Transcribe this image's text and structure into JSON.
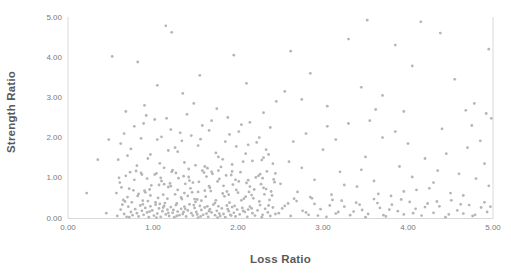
{
  "chart_data": {
    "type": "scatter",
    "title": "",
    "xlabel": "Loss Ratio",
    "ylabel": "Strength Ratio",
    "xlim": [
      0,
      5
    ],
    "ylim": [
      0,
      5
    ],
    "x_tick_labels": [
      "0.00",
      "1.00",
      "2.00",
      "3.00",
      "4.00",
      "5.00"
    ],
    "y_tick_labels": [
      "0.00",
      "1.00",
      "2.00",
      "3.00",
      "4.00",
      "5.00"
    ],
    "grid": false,
    "legend": false,
    "marker_color": "#b5b5b5",
    "axis_line_color": "#d9d9d9",
    "tick_label_color": "#7a7a7a",
    "axis_title_color": "#595959",
    "points": [
      [
        0.58,
        0.05
      ],
      [
        0.62,
        0.21
      ],
      [
        0.66,
        0.1
      ],
      [
        0.69,
        0.03
      ],
      [
        0.71,
        0.28
      ],
      [
        0.74,
        0.15
      ],
      [
        0.76,
        0.07
      ],
      [
        0.79,
        0.22
      ],
      [
        0.81,
        0.12
      ],
      [
        0.83,
        0.04
      ],
      [
        0.85,
        0.31
      ],
      [
        0.87,
        0.18
      ],
      [
        0.89,
        0.08
      ],
      [
        0.91,
        0.25
      ],
      [
        0.93,
        0.14
      ],
      [
        0.95,
        0.02
      ],
      [
        0.97,
        0.29
      ],
      [
        0.99,
        0.19
      ],
      [
        1.01,
        0.06
      ],
      [
        1.03,
        0.33
      ],
      [
        1.05,
        0.11
      ],
      [
        1.07,
        0.24
      ],
      [
        1.09,
        0.03
      ],
      [
        1.11,
        0.17
      ],
      [
        1.13,
        0.3
      ],
      [
        1.15,
        0.09
      ],
      [
        1.17,
        0.21
      ],
      [
        1.19,
        0.05
      ],
      [
        1.21,
        0.27
      ],
      [
        1.23,
        0.13
      ],
      [
        1.25,
        0.02
      ],
      [
        1.27,
        0.32
      ],
      [
        1.29,
        0.16
      ],
      [
        1.31,
        0.07
      ],
      [
        1.33,
        0.23
      ],
      [
        1.35,
        0.1
      ],
      [
        1.37,
        0.28
      ],
      [
        1.39,
        0.04
      ],
      [
        1.41,
        0.19
      ],
      [
        1.43,
        0.34
      ],
      [
        1.45,
        0.12
      ],
      [
        1.47,
        0.06
      ],
      [
        1.49,
        0.25
      ],
      [
        1.51,
        0.15
      ],
      [
        1.53,
        0.01
      ],
      [
        1.55,
        0.3
      ],
      [
        1.57,
        0.2
      ],
      [
        1.59,
        0.08
      ],
      [
        1.61,
        0.26
      ],
      [
        1.63,
        0.11
      ],
      [
        1.65,
        0.03
      ],
      [
        1.67,
        0.22
      ],
      [
        1.69,
        0.14
      ],
      [
        1.71,
        0.33
      ],
      [
        1.73,
        0.07
      ],
      [
        1.75,
        0.18
      ],
      [
        1.77,
        0.29
      ],
      [
        1.79,
        0.05
      ],
      [
        1.81,
        0.24
      ],
      [
        1.83,
        0.1
      ],
      [
        1.85,
        0.02
      ],
      [
        1.87,
        0.31
      ],
      [
        1.89,
        0.17
      ],
      [
        1.91,
        0.08
      ],
      [
        1.93,
        0.27
      ],
      [
        1.95,
        0.13
      ],
      [
        1.97,
        0.04
      ],
      [
        1.99,
        0.21
      ],
      [
        2.02,
        0.09
      ],
      [
        2.05,
        0.25
      ],
      [
        2.08,
        0.15
      ],
      [
        2.11,
        0.03
      ],
      [
        2.14,
        0.28
      ],
      [
        2.17,
        0.12
      ],
      [
        2.2,
        0.06
      ],
      [
        2.23,
        0.19
      ],
      [
        2.26,
        0.32
      ],
      [
        2.29,
        0.08
      ],
      [
        2.32,
        0.23
      ],
      [
        2.35,
        0.14
      ],
      [
        2.38,
        0.05
      ],
      [
        2.41,
        0.26
      ],
      [
        2.44,
        0.1
      ],
      [
        0.64,
        0.33
      ],
      [
        0.72,
        0.02
      ],
      [
        0.88,
        0.34
      ],
      [
        0.96,
        0.16
      ],
      [
        1.04,
        0.01
      ],
      [
        1.12,
        0.26
      ],
      [
        1.24,
        0.2
      ],
      [
        1.36,
        0.15
      ],
      [
        1.48,
        0.32
      ],
      [
        1.56,
        0.04
      ],
      [
        1.64,
        0.29
      ],
      [
        1.76,
        0.01
      ],
      [
        1.88,
        0.22
      ],
      [
        1.96,
        0.3
      ],
      [
        2.06,
        0.18
      ],
      [
        2.16,
        0.24
      ],
      [
        2.28,
        0.02
      ],
      [
        1.08,
        0.35
      ],
      [
        1.18,
        0.13
      ],
      [
        1.28,
        0.05
      ],
      [
        1.38,
        0.23
      ],
      [
        1.52,
        0.09
      ],
      [
        1.66,
        0.17
      ],
      [
        1.78,
        0.11
      ],
      [
        1.92,
        0.06
      ],
      [
        2.12,
        0.21
      ],
      [
        2.36,
        0.31
      ],
      [
        0.57,
        0.62
      ],
      [
        0.61,
        0.88
      ],
      [
        0.65,
        0.45
      ],
      [
        0.68,
        1.05
      ],
      [
        0.72,
        0.73
      ],
      [
        0.75,
        0.39
      ],
      [
        0.78,
        0.95
      ],
      [
        0.82,
        0.55
      ],
      [
        0.86,
        1.12
      ],
      [
        0.9,
        0.68
      ],
      [
        0.94,
        0.42
      ],
      [
        0.98,
        0.81
      ],
      [
        1.02,
        1.08
      ],
      [
        1.06,
        0.5
      ],
      [
        1.1,
        0.92
      ],
      [
        1.14,
        0.37
      ],
      [
        1.18,
        0.77
      ],
      [
        1.22,
        1.15
      ],
      [
        1.26,
        0.59
      ],
      [
        1.3,
        0.99
      ],
      [
        1.34,
        0.47
      ],
      [
        1.38,
        0.85
      ],
      [
        1.42,
        1.02
      ],
      [
        1.46,
        0.64
      ],
      [
        1.5,
        0.4
      ],
      [
        1.54,
        0.9
      ],
      [
        1.58,
        1.18
      ],
      [
        1.62,
        0.53
      ],
      [
        1.66,
        0.79
      ],
      [
        1.7,
        1.1
      ],
      [
        1.74,
        0.44
      ],
      [
        1.78,
        0.97
      ],
      [
        1.82,
        0.61
      ],
      [
        1.86,
        1.06
      ],
      [
        1.9,
        0.38
      ],
      [
        1.94,
        0.83
      ],
      [
        1.98,
        0.7
      ],
      [
        2.03,
        1.14
      ],
      [
        2.07,
        0.48
      ],
      [
        2.12,
        0.94
      ],
      [
        2.16,
        0.57
      ],
      [
        2.21,
        1.01
      ],
      [
        2.25,
        0.41
      ],
      [
        2.3,
        0.75
      ],
      [
        2.34,
        1.16
      ],
      [
        2.39,
        0.66
      ],
      [
        2.43,
        0.89
      ],
      [
        0.6,
        1.0
      ],
      [
        0.7,
        0.52
      ],
      [
        0.8,
        1.17
      ],
      [
        0.88,
        0.43
      ],
      [
        0.96,
        0.71
      ],
      [
        1.04,
        1.11
      ],
      [
        1.12,
        0.58
      ],
      [
        1.2,
        0.86
      ],
      [
        1.28,
        0.36
      ],
      [
        1.36,
        1.04
      ],
      [
        1.44,
        0.74
      ],
      [
        1.52,
        0.46
      ],
      [
        1.6,
        1.13
      ],
      [
        1.68,
        0.67
      ],
      [
        1.76,
        0.91
      ],
      [
        1.84,
        0.54
      ],
      [
        1.92,
        1.07
      ],
      [
        2.0,
        0.63
      ],
      [
        2.1,
        0.87
      ],
      [
        2.18,
        0.49
      ],
      [
        2.26,
        1.09
      ],
      [
        2.33,
        0.72
      ],
      [
        2.4,
        0.56
      ],
      [
        0.63,
        0.76
      ],
      [
        0.73,
        1.14
      ],
      [
        0.83,
        0.6
      ],
      [
        0.93,
        0.98
      ],
      [
        1.03,
        0.39
      ],
      [
        1.13,
        0.84
      ],
      [
        1.23,
        1.19
      ],
      [
        1.33,
        0.51
      ],
      [
        1.43,
        0.93
      ],
      [
        1.53,
        0.65
      ],
      [
        1.63,
        1.03
      ],
      [
        1.73,
        0.37
      ],
      [
        1.83,
        0.8
      ],
      [
        1.93,
        1.16
      ],
      [
        2.04,
        0.44
      ],
      [
        2.14,
        0.78
      ],
      [
        2.24,
        1.05
      ],
      [
        2.31,
        0.59
      ],
      [
        2.42,
        0.96
      ],
      [
        0.67,
        0.41
      ],
      [
        0.77,
        0.69
      ],
      [
        0.87,
        1.08
      ],
      [
        0.97,
        0.56
      ],
      [
        1.07,
        0.82
      ],
      [
        1.17,
        0.48
      ],
      [
        1.27,
        1.12
      ],
      [
        1.37,
        0.62
      ],
      [
        1.47,
        0.88
      ],
      [
        1.57,
        0.43
      ],
      [
        1.67,
        0.75
      ],
      [
        1.77,
        1.18
      ],
      [
        1.87,
        0.66
      ],
      [
        1.97,
        0.95
      ],
      [
        2.09,
        0.53
      ],
      [
        2.19,
        0.71
      ],
      [
        2.29,
        0.99
      ],
      [
        2.37,
        0.45
      ],
      [
        0.91,
        0.64
      ],
      [
        1.09,
        1.0
      ],
      [
        1.29,
        0.7
      ],
      [
        1.49,
        0.47
      ],
      [
        1.69,
        1.15
      ],
      [
        1.89,
        0.58
      ],
      [
        2.01,
        0.91
      ],
      [
        2.13,
        0.65
      ],
      [
        2.27,
        0.84
      ],
      [
        2.44,
        1.11
      ],
      [
        1.21,
        0.79
      ],
      [
        1.41,
        0.55
      ],
      [
        1.61,
        0.68
      ],
      [
        0.59,
        1.45
      ],
      [
        0.66,
        2.1
      ],
      [
        0.74,
        1.72
      ],
      [
        0.81,
        1.3
      ],
      [
        0.89,
        2.35
      ],
      [
        0.97,
        1.58
      ],
      [
        1.05,
        1.95
      ],
      [
        1.13,
        1.25
      ],
      [
        1.21,
        2.2
      ],
      [
        1.29,
        1.65
      ],
      [
        1.37,
        1.38
      ],
      [
        1.45,
        2.05
      ],
      [
        1.53,
        1.8
      ],
      [
        1.61,
        1.28
      ],
      [
        1.69,
        2.42
      ],
      [
        1.77,
        1.52
      ],
      [
        1.85,
        1.9
      ],
      [
        1.93,
        1.33
      ],
      [
        2.01,
        2.15
      ],
      [
        2.09,
        1.6
      ],
      [
        2.17,
        1.42
      ],
      [
        2.25,
        2.0
      ],
      [
        2.33,
        1.7
      ],
      [
        2.41,
        1.35
      ],
      [
        0.62,
        1.85
      ],
      [
        0.78,
        2.28
      ],
      [
        0.94,
        1.48
      ],
      [
        1.1,
        2.02
      ],
      [
        1.26,
        1.75
      ],
      [
        1.42,
        1.22
      ],
      [
        1.58,
        2.3
      ],
      [
        1.74,
        1.62
      ],
      [
        1.9,
        2.08
      ],
      [
        2.06,
        1.4
      ],
      [
        2.22,
        1.88
      ],
      [
        2.38,
        2.25
      ],
      [
        0.7,
        1.55
      ],
      [
        0.86,
        1.98
      ],
      [
        1.02,
        2.45
      ],
      [
        1.18,
        1.68
      ],
      [
        1.34,
        1.92
      ],
      [
        1.5,
        1.31
      ],
      [
        1.66,
        2.18
      ],
      [
        1.82,
        1.46
      ],
      [
        1.98,
        1.78
      ],
      [
        2.14,
        2.38
      ],
      [
        2.3,
        1.5
      ],
      [
        0.92,
        2.55
      ],
      [
        1.16,
        2.48
      ],
      [
        1.4,
        2.58
      ],
      [
        1.64,
        1.24
      ],
      [
        1.88,
        2.5
      ],
      [
        2.12,
        1.82
      ],
      [
        2.36,
        1.58
      ],
      [
        1.08,
        1.36
      ],
      [
        1.32,
        2.12
      ],
      [
        1.56,
        1.96
      ],
      [
        1.8,
        1.27
      ],
      [
        2.04,
        2.32
      ],
      [
        2.28,
        1.44
      ],
      [
        2.48,
        0.12
      ],
      [
        2.55,
        0.3
      ],
      [
        2.62,
        0.05
      ],
      [
        2.69,
        0.42
      ],
      [
        2.76,
        0.18
      ],
      [
        2.83,
        0.08
      ],
      [
        2.9,
        0.35
      ],
      [
        2.97,
        0.22
      ],
      [
        3.04,
        0.03
      ],
      [
        3.11,
        0.45
      ],
      [
        3.18,
        0.15
      ],
      [
        3.25,
        0.28
      ],
      [
        3.32,
        0.07
      ],
      [
        3.39,
        0.38
      ],
      [
        3.46,
        0.2
      ],
      [
        3.53,
        0.1
      ],
      [
        3.6,
        0.47
      ],
      [
        3.67,
        0.25
      ],
      [
        3.74,
        0.04
      ],
      [
        3.81,
        0.33
      ],
      [
        3.88,
        0.17
      ],
      [
        3.95,
        0.09
      ],
      [
        4.02,
        0.4
      ],
      [
        4.09,
        0.23
      ],
      [
        4.16,
        0.06
      ],
      [
        4.23,
        0.36
      ],
      [
        4.3,
        0.13
      ],
      [
        4.37,
        0.29
      ],
      [
        4.44,
        0.02
      ],
      [
        4.51,
        0.44
      ],
      [
        4.58,
        0.19
      ],
      [
        4.65,
        0.11
      ],
      [
        4.72,
        0.32
      ],
      [
        4.79,
        0.08
      ],
      [
        4.86,
        0.26
      ],
      [
        4.93,
        0.15
      ],
      [
        2.52,
        0.24
      ],
      [
        2.66,
        0.48
      ],
      [
        2.8,
        0.14
      ],
      [
        2.94,
        0.06
      ],
      [
        3.08,
        0.31
      ],
      [
        3.22,
        0.43
      ],
      [
        3.36,
        0.16
      ],
      [
        3.5,
        0.02
      ],
      [
        3.64,
        0.37
      ],
      [
        3.78,
        0.21
      ],
      [
        3.92,
        0.46
      ],
      [
        4.06,
        0.12
      ],
      [
        4.2,
        0.27
      ],
      [
        4.34,
        0.41
      ],
      [
        4.48,
        0.09
      ],
      [
        4.62,
        0.34
      ],
      [
        4.76,
        0.05
      ],
      [
        4.9,
        0.39
      ],
      [
        4.97,
        0.28
      ],
      [
        2.59,
        0.36
      ],
      [
        2.87,
        0.49
      ],
      [
        3.15,
        0.11
      ],
      [
        3.43,
        0.33
      ],
      [
        3.71,
        0.07
      ],
      [
        2.5,
        0.85
      ],
      [
        2.6,
        1.4
      ],
      [
        2.7,
        0.65
      ],
      [
        2.8,
        2.1
      ],
      [
        2.9,
        0.95
      ],
      [
        3.0,
        1.7
      ],
      [
        3.1,
        0.58
      ],
      [
        3.2,
        1.15
      ],
      [
        3.3,
        2.35
      ],
      [
        3.4,
        0.78
      ],
      [
        3.5,
        1.52
      ],
      [
        3.6,
        0.92
      ],
      [
        3.7,
        2.0
      ],
      [
        3.8,
        0.55
      ],
      [
        3.9,
        1.28
      ],
      [
        4.0,
        1.85
      ],
      [
        4.1,
        0.7
      ],
      [
        4.2,
        1.48
      ],
      [
        4.3,
        0.88
      ],
      [
        4.4,
        2.22
      ],
      [
        4.5,
        0.62
      ],
      [
        4.6,
        1.1
      ],
      [
        4.7,
        1.75
      ],
      [
        4.8,
        0.98
      ],
      [
        4.9,
        1.35
      ],
      [
        4.98,
        2.48
      ],
      [
        2.65,
        1.9
      ],
      [
        2.85,
        0.52
      ],
      [
        3.05,
        2.28
      ],
      [
        3.25,
        0.82
      ],
      [
        3.45,
        1.2
      ],
      [
        3.65,
        0.6
      ],
      [
        3.85,
        2.15
      ],
      [
        4.05,
        1.02
      ],
      [
        4.25,
        0.74
      ],
      [
        4.45,
        1.6
      ],
      [
        4.65,
        0.56
      ],
      [
        4.85,
        1.92
      ],
      [
        2.75,
        1.25
      ],
      [
        3.15,
        1.95
      ],
      [
        3.55,
        2.42
      ],
      [
        3.95,
        0.66
      ],
      [
        4.35,
        1.18
      ],
      [
        4.75,
        2.3
      ],
      [
        4.95,
        0.8
      ],
      [
        0.52,
        4.02
      ],
      [
        0.82,
        3.88
      ],
      [
        1.15,
        4.78
      ],
      [
        1.22,
        4.62
      ],
      [
        0.9,
        2.8
      ],
      [
        1.35,
        3.1
      ],
      [
        1.75,
        2.72
      ],
      [
        2.1,
        3.35
      ],
      [
        2.45,
        2.9
      ],
      [
        2.62,
        4.15
      ],
      [
        2.85,
        3.6
      ],
      [
        3.05,
        2.78
      ],
      [
        3.3,
        4.45
      ],
      [
        3.52,
        4.92
      ],
      [
        3.7,
        3.05
      ],
      [
        3.95,
        2.65
      ],
      [
        4.15,
        4.88
      ],
      [
        4.38,
        4.6
      ],
      [
        4.55,
        3.45
      ],
      [
        4.78,
        2.85
      ],
      [
        4.95,
        4.2
      ],
      [
        1.55,
        3.55
      ],
      [
        1.95,
        4.05
      ],
      [
        2.3,
        2.62
      ],
      [
        2.75,
        2.95
      ],
      [
        3.45,
        3.25
      ],
      [
        4.05,
        3.78
      ],
      [
        4.68,
        2.68
      ],
      [
        1.05,
        3.3
      ],
      [
        0.68,
        2.65
      ],
      [
        2.55,
        3.15
      ],
      [
        3.85,
        4.3
      ],
      [
        4.92,
        2.6
      ],
      [
        1.48,
        2.85
      ],
      [
        3.62,
        2.7
      ],
      [
        0.22,
        0.62
      ],
      [
        0.45,
        0.12
      ],
      [
        0.35,
        1.45
      ],
      [
        0.48,
        1.95
      ]
    ]
  }
}
